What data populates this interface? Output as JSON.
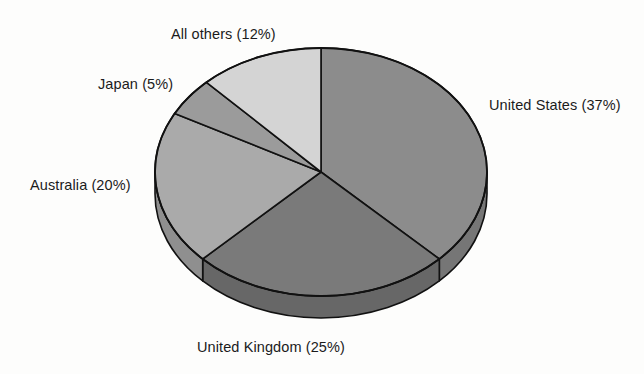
{
  "chart_data": {
    "type": "pie",
    "title": "",
    "subtitle": "",
    "xlabel": "",
    "ylabel": "",
    "legend_position": "none",
    "grid": false,
    "units": "percent",
    "three_d": true,
    "start_angle_deg": 0,
    "direction": "clockwise",
    "categories": [
      "United States",
      "United Kingdom",
      "Australia",
      "Japan",
      "All others"
    ],
    "values": [
      37,
      25,
      20,
      5,
      12
    ],
    "slices": [
      {
        "name": "United States",
        "value": 37,
        "value_text": "37%",
        "label": "United States (37%)",
        "color": "#8c8c8c",
        "side_color": "#767676",
        "label_position": "right"
      },
      {
        "name": "United Kingdom",
        "value": 25,
        "value_text": "25%",
        "label": "United Kingdom (25%)",
        "color": "#7a7a7a",
        "side_color": "#676767",
        "label_position": "bottom"
      },
      {
        "name": "Australia",
        "value": 20,
        "value_text": "20%",
        "label": "Australia (20%)",
        "color": "#aaaaaa",
        "side_color": "#8f8f8f",
        "label_position": "left"
      },
      {
        "name": "Japan",
        "value": 5,
        "value_text": "5%",
        "label": "Japan (5%)",
        "color": "#9b9b9b",
        "side_color": "#838383",
        "label_position": "upper-left"
      },
      {
        "name": "All others",
        "value": 12,
        "value_text": "12%",
        "label": "All others (12%)",
        "color": "#d4d4d4",
        "side_color": "#b4b4b4",
        "label_position": "top"
      }
    ],
    "total": 99,
    "outline_color": "#111111",
    "background_color": "#fdfdfc"
  },
  "labels": {
    "united_states": "United States (37%)",
    "united_kingdom": "United Kingdom (25%)",
    "australia": "Australia (20%)",
    "japan": "Japan (5%)",
    "all_others": "All others (12%)"
  }
}
